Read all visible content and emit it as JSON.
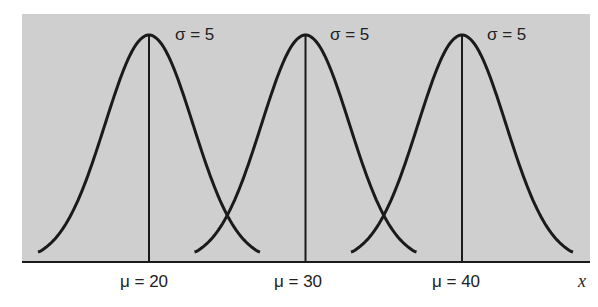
{
  "chart_data": {
    "type": "line",
    "title": "",
    "xlabel": "x",
    "ylabel": "",
    "grid": false,
    "legend": null,
    "series": [
      {
        "name": "mu=20, sigma=5",
        "mean": 20,
        "sd": 5
      },
      {
        "name": "mu=30, sigma=5",
        "mean": 30,
        "sd": 5
      },
      {
        "name": "mu=40, sigma=5",
        "mean": 40,
        "sd": 5
      }
    ],
    "annotations": {
      "sigma_labels": [
        "σ = 5",
        "σ = 5",
        "σ = 5"
      ],
      "mean_labels": [
        "μ = 20",
        "μ = 30",
        "μ = 40"
      ],
      "x_axis_label": "x"
    },
    "background": "#cfcfcf"
  }
}
